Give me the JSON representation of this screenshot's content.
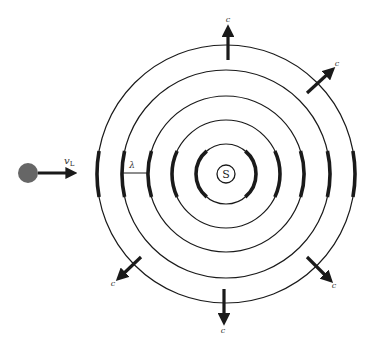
{
  "diagram": {
    "source": {
      "label": "S",
      "cx": 226,
      "cy": 174,
      "r": 9
    },
    "wavefront_radii": [
      30,
      54,
      78,
      104,
      129
    ],
    "listener": {
      "cx": 28,
      "cy": 173,
      "r": 10,
      "color": "#666666",
      "velocity_label": "v",
      "velocity_subscript": "L"
    },
    "wavelength_label": "λ",
    "wave_speed_label": "c",
    "wave_speed_arrows": [
      {
        "name": "top",
        "x1": 228,
        "y1": 60,
        "x2": 228,
        "y2": 30,
        "lx": 228,
        "ly": 22
      },
      {
        "name": "upper-right",
        "x1": 307,
        "y1": 93,
        "x2": 331,
        "y2": 71,
        "lx": 337,
        "ly": 66
      },
      {
        "name": "lower-right",
        "x1": 307,
        "y1": 257,
        "x2": 329,
        "y2": 279,
        "lx": 334,
        "ly": 288
      },
      {
        "name": "bottom",
        "x1": 224,
        "y1": 289,
        "x2": 224,
        "y2": 320,
        "lx": 223,
        "ly": 333
      },
      {
        "name": "lower-left",
        "x1": 141,
        "y1": 257,
        "x2": 120,
        "y2": 277,
        "lx": 113,
        "ly": 286
      }
    ],
    "colors": {
      "line": "#1a1a1a",
      "listener": "#666666",
      "background": "#ffffff"
    }
  }
}
